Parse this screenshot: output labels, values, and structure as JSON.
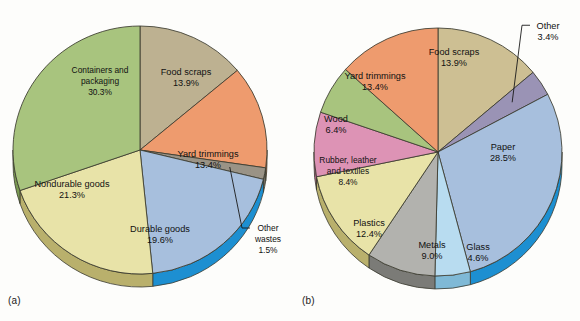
{
  "figure": {
    "background_color": "#fdfdfb",
    "text_color": "#111111",
    "outline_color": "#3a3a2e"
  },
  "panels": [
    {
      "id": "a",
      "caption": "(a)",
      "center": {
        "x": 140,
        "y": 150
      },
      "radius": {
        "rx": 127,
        "ry": 124
      },
      "depth": 13
    },
    {
      "id": "b",
      "caption": "(b)",
      "center": {
        "x": 148,
        "y": 152
      },
      "radius": {
        "rx": 124,
        "ry": 124
      },
      "depth": 13
    }
  ],
  "chart_data": [
    {
      "type": "pie",
      "title": "",
      "panel": "(a)",
      "start_angle_deg": 0,
      "direction": "clockwise",
      "units": "percent",
      "categories": [
        "Food scraps",
        "Yard trimmings",
        "Other wastes",
        "Durable goods",
        "Nondurable goods",
        "Containers and packaging"
      ],
      "values": [
        13.9,
        13.4,
        1.5,
        19.6,
        21.3,
        30.3
      ],
      "labels": [
        {
          "name": "Food scraps",
          "value": "13.9%",
          "lines": [
            "Food scraps",
            "13.9%"
          ],
          "color": "#bdb191",
          "side_color": "#8e855f",
          "callout": false,
          "lx": 186,
          "ly": 78
        },
        {
          "name": "Yard trimmings",
          "value": "13.4%",
          "lines": [
            "Yard trimmings",
            "13.4%"
          ],
          "color": "#ee9b6e",
          "side_color": "#d2774a",
          "callout": false,
          "lx": 208,
          "ly": 160
        },
        {
          "name": "Other wastes",
          "value": "1.5%",
          "lines": [
            "Other",
            "wastes",
            "1.5%"
          ],
          "color": "#9a9386",
          "side_color": "#6f6a5e",
          "callout": true,
          "lx": 268,
          "ly": 240
        },
        {
          "name": "Durable goods",
          "value": "19.6%",
          "lines": [
            "Durable goods",
            "19.6%"
          ],
          "color": "#a7bfdd",
          "side_color": "#1d8fd1",
          "callout": false,
          "lx": 160,
          "ly": 235
        },
        {
          "name": "Nondurable goods",
          "value": "21.3%",
          "lines": [
            "Nondurable goods",
            "21.3%"
          ],
          "color": "#e8e3a8",
          "side_color": "#b9b06c",
          "callout": false,
          "lx": 72,
          "ly": 190
        },
        {
          "name": "Containers and packaging",
          "value": "30.3%",
          "lines": [
            "Containers and",
            "packaging",
            "30.3%"
          ],
          "color": "#a8c47e",
          "side_color": "#7a9a52",
          "callout": false,
          "lx": 100,
          "ly": 82
        }
      ],
      "ylabel": "",
      "xlabel": "",
      "legend": "none",
      "grid": false
    },
    {
      "type": "pie",
      "title": "",
      "panel": "(b)",
      "start_angle_deg": 0,
      "direction": "clockwise",
      "units": "percent",
      "categories": [
        "Food scraps",
        "Other",
        "Paper",
        "Glass",
        "Metals",
        "Plastics",
        "Rubber, leather and textiles",
        "Wood",
        "Yard trimmings"
      ],
      "values": [
        13.9,
        3.4,
        28.5,
        4.6,
        9.0,
        12.4,
        8.4,
        6.4,
        13.4
      ],
      "labels": [
        {
          "name": "Food scraps",
          "value": "13.9%",
          "lines": [
            "Food scraps",
            "13.9%"
          ],
          "color": "#cdbf93",
          "side_color": "#9a8f61",
          "callout": false,
          "lx": 164,
          "ly": 58
        },
        {
          "name": "Other",
          "value": "3.4%",
          "lines": [
            "Other",
            "3.4%"
          ],
          "color": "#9a93b5",
          "side_color": "#6e6790",
          "callout": true,
          "lx": 258,
          "ly": 32
        },
        {
          "name": "Paper",
          "value": "28.5%",
          "lines": [
            "Paper",
            "28.5%"
          ],
          "color": "#a7bfdd",
          "side_color": "#1d8fd1",
          "callout": false,
          "lx": 213,
          "ly": 153
        },
        {
          "name": "Glass",
          "value": "4.6%",
          "lines": [
            "Glass",
            "4.6%"
          ],
          "color": "#b8dcf0",
          "side_color": "#7fb9d6",
          "callout": false,
          "lx": 188,
          "ly": 253
        },
        {
          "name": "Metals",
          "value": "9.0%",
          "lines": [
            "Metals",
            "9.0%"
          ],
          "color": "#b2b2ae",
          "side_color": "#7b7b77",
          "callout": false,
          "lx": 142,
          "ly": 251
        },
        {
          "name": "Plastics",
          "value": "12.4%",
          "lines": [
            "Plastics",
            "12.4%"
          ],
          "color": "#e8e3a8",
          "side_color": "#b9b06c",
          "callout": false,
          "lx": 79,
          "ly": 229
        },
        {
          "name": "Rubber, leather and textiles",
          "value": "8.4%",
          "lines": [
            "Rubber, leather",
            "and textiles",
            "8.4%"
          ],
          "color": "#dd93b5",
          "side_color": "#b06287",
          "callout": false,
          "lx": 58,
          "ly": 172
        },
        {
          "name": "Wood",
          "value": "6.4%",
          "lines": [
            "Wood",
            "6.4%"
          ],
          "color": "#a8c47e",
          "side_color": "#7a9a52",
          "callout": false,
          "lx": 46,
          "ly": 125
        },
        {
          "name": "Yard trimmings",
          "value": "13.4%",
          "lines": [
            "Yard trimmings",
            "13.4%"
          ],
          "color": "#ee9b6e",
          "side_color": "#d2774a",
          "callout": false,
          "lx": 85,
          "ly": 82
        }
      ],
      "ylabel": "",
      "xlabel": "",
      "legend": "none",
      "grid": false
    }
  ]
}
